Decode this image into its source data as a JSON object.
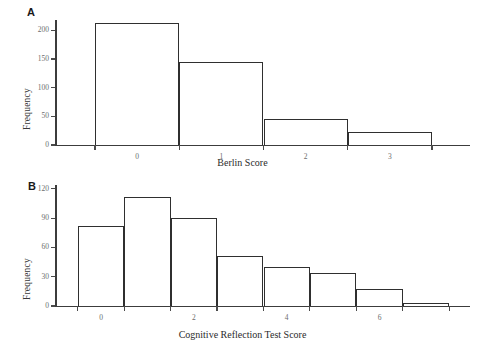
{
  "figure": {
    "panels": [
      {
        "id": "A",
        "label": "A",
        "xlabel": "Berlin Score",
        "ylabel": "Frequency"
      },
      {
        "id": "B",
        "label": "B",
        "xlabel": "Cognitive Reflection Test Score",
        "ylabel": "Frequency"
      }
    ]
  },
  "chart_data": [
    {
      "type": "bar",
      "panel": "A",
      "title": "",
      "xlabel": "Berlin Score",
      "ylabel": "Frequency",
      "categories": [
        "0",
        "1",
        "2",
        "3"
      ],
      "values": [
        212,
        145,
        46,
        23
      ],
      "bin_edges": [
        -0.5,
        0.5,
        1.5,
        2.5,
        3.5
      ],
      "xticks": [
        -0.5,
        0.5,
        1.5,
        2.5,
        3.5
      ],
      "xticklabels": [
        "0",
        "1",
        "2",
        "3"
      ],
      "yticks": [
        0,
        50,
        100,
        150,
        200
      ],
      "yticklabels": [
        "0",
        "50",
        "100",
        "150",
        "200"
      ],
      "ylim": [
        0,
        218
      ],
      "xlim": [
        -0.95,
        3.95
      ],
      "grid": false,
      "legend": null
    },
    {
      "type": "bar",
      "panel": "B",
      "title": "",
      "xlabel": "Cognitive Reflection Test Score",
      "ylabel": "Frequency",
      "categories": [
        "0",
        "1",
        "2",
        "3",
        "4",
        "5",
        "6",
        "7"
      ],
      "values": [
        82,
        112,
        90,
        51,
        40,
        34,
        17,
        3
      ],
      "bin_edges": [
        -0.5,
        0.5,
        1.5,
        2.5,
        3.5,
        4.5,
        5.5,
        6.5,
        7.5
      ],
      "xticks": [
        -0.5,
        0.5,
        1.5,
        2.5,
        3.5,
        4.5,
        5.5,
        6.5,
        7.5
      ],
      "xticklabels": [
        "0",
        "2",
        "4",
        "6"
      ],
      "xticklabel_positions": [
        0,
        2,
        4,
        6
      ],
      "yticks": [
        0,
        30,
        60,
        90,
        120
      ],
      "yticklabels": [
        "0",
        "30",
        "60",
        "90",
        "120"
      ],
      "ylim": [
        0,
        124
      ],
      "xlim": [
        -0.95,
        7.95
      ],
      "grid": false,
      "legend": null
    }
  ]
}
